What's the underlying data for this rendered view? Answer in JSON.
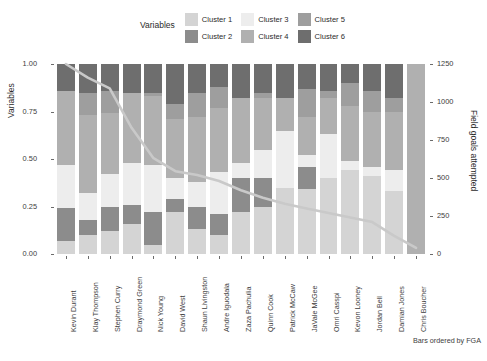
{
  "legend": {
    "title": "Variables",
    "entries": [
      {
        "label": "Cluster 1",
        "color": "#d4d4d4"
      },
      {
        "label": "Cluster 2",
        "color": "#8c8c8c"
      },
      {
        "label": "Cluster 3",
        "color": "#ededed"
      },
      {
        "label": "Cluster 4",
        "color": "#b0b0b0"
      },
      {
        "label": "Cluster 5",
        "color": "#9e9e9e"
      },
      {
        "label": "Cluster 6",
        "color": "#6e6e6e"
      }
    ]
  },
  "caption": "Bars ordered by FGA",
  "chart_data": {
    "type": "bar",
    "title": "",
    "subtitle": "",
    "xlabel": "",
    "ylabel": "Variables",
    "y2label": "Field goals attempted",
    "ylim": [
      0,
      1
    ],
    "y2lim": [
      0,
      1250
    ],
    "yticks": [
      "0.00",
      "0.25",
      "0.50",
      "0.75",
      "1.00"
    ],
    "ytick_values": [
      0,
      0.25,
      0.5,
      0.75,
      1
    ],
    "y2ticks": [
      "0",
      "250",
      "500",
      "750",
      "1000",
      "1250"
    ],
    "y2tick_values": [
      0,
      250,
      500,
      750,
      1000,
      1250
    ],
    "grid": false,
    "legend_position": "top",
    "stacked": true,
    "categories": [
      "Kevin Durant",
      "Klay Thompson",
      "Stephen Curry",
      "Draymond Green",
      "Nick Young",
      "David West",
      "Shaun Livingston",
      "Andre Iguodala",
      "Zaza Pachulia",
      "Quinn Cook",
      "Patrick McCaw",
      "JaVale McGee",
      "Omri Casspi",
      "Kevon Looney",
      "Jordan Bell",
      "Damian Jones",
      "Chris Boucher"
    ],
    "series": [
      {
        "name": "Cluster 1",
        "color": "#d4d4d4",
        "values": [
          0.07,
          0.1,
          0.12,
          0.16,
          0.05,
          0.22,
          0.13,
          0.1,
          0.22,
          0.25,
          0.35,
          0.34,
          0.4,
          0.44,
          0.41,
          0.33,
          0.0
        ]
      },
      {
        "name": "Cluster 2",
        "color": "#8c8c8c",
        "values": [
          0.17,
          0.08,
          0.13,
          0.1,
          0.17,
          0.07,
          0.12,
          0.11,
          0.18,
          0.15,
          0.0,
          0.12,
          0.0,
          0.0,
          0.0,
          0.0,
          0.0
        ]
      },
      {
        "name": "Cluster 3",
        "color": "#ededed",
        "values": [
          0.23,
          0.14,
          0.17,
          0.22,
          0.25,
          0.11,
          0.13,
          0.22,
          0.08,
          0.15,
          0.3,
          0.06,
          0.23,
          0.05,
          0.05,
          0.11,
          0.0
        ]
      },
      {
        "name": "Cluster 4",
        "color": "#b0b0b0",
        "values": [
          0.39,
          0.41,
          0.32,
          0.37,
          0.36,
          0.31,
          0.34,
          0.34,
          0.34,
          0.27,
          0.17,
          0.2,
          0.19,
          0.29,
          0.29,
          0.31,
          1.0
        ]
      },
      {
        "name": "Cluster 5",
        "color": "#9e9e9e",
        "values": [
          0.0,
          0.12,
          0.12,
          0.0,
          0.02,
          0.08,
          0.13,
          0.11,
          0.0,
          0.03,
          0.0,
          0.15,
          0.04,
          0.12,
          0.11,
          0.07,
          0.0
        ]
      },
      {
        "name": "Cluster 6",
        "color": "#6e6e6e",
        "values": [
          0.14,
          0.15,
          0.14,
          0.15,
          0.15,
          0.21,
          0.15,
          0.12,
          0.18,
          0.15,
          0.18,
          0.13,
          0.14,
          0.1,
          0.14,
          0.18,
          0.0
        ]
      }
    ],
    "line_series": {
      "name": "Field goals attempted",
      "color": "#c9c9c9",
      "axis": "y2",
      "values": [
        1250,
        1160,
        1090,
        830,
        630,
        545,
        520,
        480,
        420,
        370,
        330,
        300,
        270,
        240,
        210,
        120,
        40
      ]
    }
  }
}
